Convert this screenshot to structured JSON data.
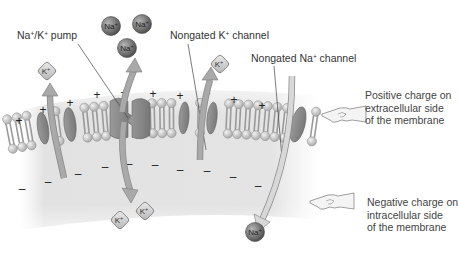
{
  "labels": {
    "pump": {
      "pre": "Na",
      "sup1": "+",
      "mid": "/K",
      "sup2": "+",
      "post": " pump"
    },
    "k_channel": {
      "pre": "Nongated K",
      "sup": "+",
      "post": " channel"
    },
    "na_channel": {
      "pre": "Nongated Na",
      "sup": "+",
      "post": " channel"
    }
  },
  "side_notes": {
    "positive": [
      "Positive charge on",
      "extracellular side",
      "of the membrane"
    ],
    "negative": [
      "Negative charge on",
      "intracellular side",
      "of the membrane"
    ]
  },
  "ions": {
    "na_label": "Na",
    "k_label": "K",
    "charge": "+"
  },
  "charges": {
    "extracellular": "+",
    "intracellular": "–"
  },
  "colors": {
    "na_ion": "#7a7a7a",
    "k_ion": "#cfcfcf",
    "protein": "#8c8c8c",
    "arrow": "#a9a9a9",
    "lipid_head": "#d6d6d6",
    "membrane_bg": "#e6e6e6"
  }
}
